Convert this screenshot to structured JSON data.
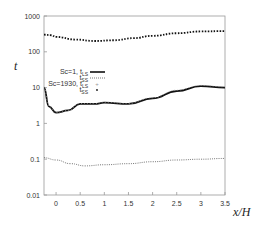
{
  "chart_data": {
    "type": "line",
    "title": "",
    "xlabel": "x/H",
    "ylabel": "t",
    "xlim": [
      -0.25,
      3.5
    ],
    "ylim": [
      0.01,
      1000
    ],
    "yscale": "log",
    "grid": false,
    "legend_position": "inside-left-middle",
    "x_ticks": [
      "0",
      "0.5",
      "1",
      "1.5",
      "2",
      "2.5",
      "3",
      "3.5"
    ],
    "y_ticks": [
      "0.01",
      "0.1",
      "1",
      "10",
      "100",
      "1000"
    ],
    "legend": [
      {
        "label": "Sc=1, t_LS",
        "style": "solid-thick"
      },
      {
        "label": "t_SS",
        "style": "dotted"
      },
      {
        "label": "Sc=1930, t_LS",
        "style": "plus-markers"
      },
      {
        "label": "t_SS",
        "style": "dot-markers"
      }
    ],
    "series": [
      {
        "name": "Sc=1, t_LS",
        "x": [
          -0.25,
          -0.15,
          0,
          0.25,
          0.5,
          0.8,
          1.0,
          1.5,
          2.0,
          2.5,
          3.0,
          3.5
        ],
        "values": [
          10,
          3,
          2.0,
          2.3,
          3.5,
          3.5,
          3.8,
          3.5,
          5,
          8,
          11,
          10
        ]
      },
      {
        "name": "Sc=1, t_SS",
        "x": [
          -0.25,
          0,
          0.3,
          0.6,
          1.0,
          1.5,
          2.0,
          2.5,
          3.0,
          3.5
        ],
        "values": [
          0.11,
          0.095,
          0.075,
          0.065,
          0.07,
          0.075,
          0.085,
          0.095,
          0.1,
          0.105
        ]
      },
      {
        "name": "Sc=1930, t_LS",
        "x": [
          -0.25,
          -0.15,
          0,
          0.25,
          0.5,
          0.8,
          1.0,
          1.5,
          2.0,
          2.5,
          3.0,
          3.5
        ],
        "values": [
          10,
          3,
          2.0,
          2.3,
          3.6,
          3.6,
          3.9,
          3.6,
          5.2,
          8.5,
          11.5,
          10.5
        ]
      },
      {
        "name": "Sc=1930, t_SS",
        "x": [
          -0.25,
          -0.1,
          0,
          0.4,
          0.8,
          1.2,
          1.6,
          2.0,
          2.5,
          3.0,
          3.5
        ],
        "values": [
          300,
          290,
          260,
          220,
          200,
          210,
          240,
          280,
          330,
          370,
          380
        ]
      }
    ]
  }
}
